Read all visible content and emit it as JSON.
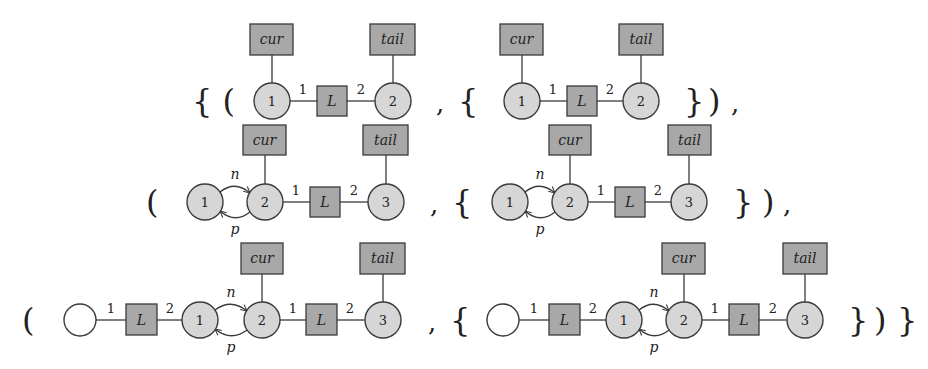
{
  "diagram": {
    "colors": {
      "node_fill": "#d6d6d6",
      "box_fill": "#a8a8a8",
      "stroke": "#3a3a3a",
      "empty_node_fill": "#ffffff"
    },
    "labels": {
      "cur": "cur",
      "tail": "tail",
      "L": "L",
      "n": "n",
      "p": "p",
      "one": "1",
      "two": "2",
      "three": "3"
    },
    "delimiters": {
      "row1_open": "{ (",
      "row1_comma1": ",",
      "row1_brace_open": "{",
      "row1_brace_close": "}",
      "row1_paren_close": ")",
      "row1_comma2": ",",
      "row2_paren_open": "(",
      "row2_comma1": ",",
      "row2_brace_open": "{",
      "row2_brace_close": "}",
      "row2_paren_close": ")",
      "row2_comma2": ",",
      "row3_paren_open": "(",
      "row3_comma1": ",",
      "row3_brace_open": "{",
      "row3_brace_close": "}",
      "row3_paren_close": ")",
      "row3_outer_close": "}"
    },
    "rows": [
      {
        "name": "pair-1",
        "graphs": [
          {
            "nodes": [
              "1",
              "2"
            ],
            "hyperedges": [
              "L(1,2)"
            ],
            "pointers": {
              "cur": "1",
              "tail": "2"
            }
          },
          {
            "nodes": [
              "1",
              "2"
            ],
            "hyperedges": [
              "L(1,2)"
            ],
            "pointers": {
              "cur": "1",
              "tail": "2"
            }
          }
        ]
      },
      {
        "name": "pair-2",
        "graphs": [
          {
            "nodes": [
              "1",
              "2",
              "3"
            ],
            "edges": [
              "n: 1→2",
              "p: 2→1"
            ],
            "hyperedges": [
              "L(2,3)"
            ],
            "pointers": {
              "cur": "2",
              "tail": "3"
            }
          },
          {
            "nodes": [
              "1",
              "2",
              "3"
            ],
            "edges": [
              "n: 1→2",
              "p: 2→1"
            ],
            "hyperedges": [
              "L(2,3)"
            ],
            "pointers": {
              "cur": "2",
              "tail": "3"
            }
          }
        ]
      },
      {
        "name": "pair-3",
        "graphs": [
          {
            "nodes": [
              "(anonymous)",
              "1",
              "2",
              "3"
            ],
            "edges": [
              "n: 1→2",
              "p: 2→1"
            ],
            "hyperedges": [
              "L(anon,1)",
              "L(2,3)"
            ],
            "pointers": {
              "cur": "2",
              "tail": "3"
            }
          },
          {
            "nodes": [
              "(anonymous)",
              "1",
              "2",
              "3"
            ],
            "edges": [
              "n: 1→2",
              "p: 2→1"
            ],
            "hyperedges": [
              "L(anon,1)",
              "L(2,3)"
            ],
            "pointers": {
              "cur": "2",
              "tail": "3"
            }
          }
        ]
      }
    ]
  }
}
